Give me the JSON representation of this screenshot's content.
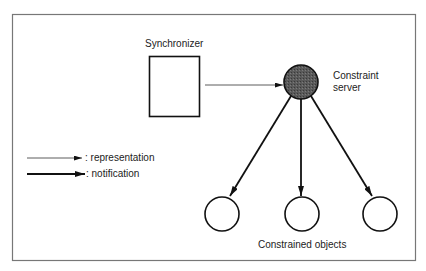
{
  "diagram": {
    "nodes": {
      "synchronizer": {
        "label": "Synchronizer",
        "shape": "rectangle"
      },
      "server": {
        "label_line1": "Constraint",
        "label_line2": "server",
        "shape": "filled-circle",
        "fill": "#555555"
      },
      "objects": {
        "label": "Constrained objects",
        "count": 3,
        "shape": "circle"
      }
    },
    "edges": [
      {
        "from": "synchronizer",
        "to": "server",
        "kind": "representation"
      },
      {
        "from": "server",
        "to": "object-1",
        "kind": "notification"
      },
      {
        "from": "server",
        "to": "object-2",
        "kind": "notification"
      },
      {
        "from": "server",
        "to": "object-3",
        "kind": "notification"
      }
    ],
    "legend": {
      "representation": ": representation",
      "notification": ": notification"
    }
  }
}
